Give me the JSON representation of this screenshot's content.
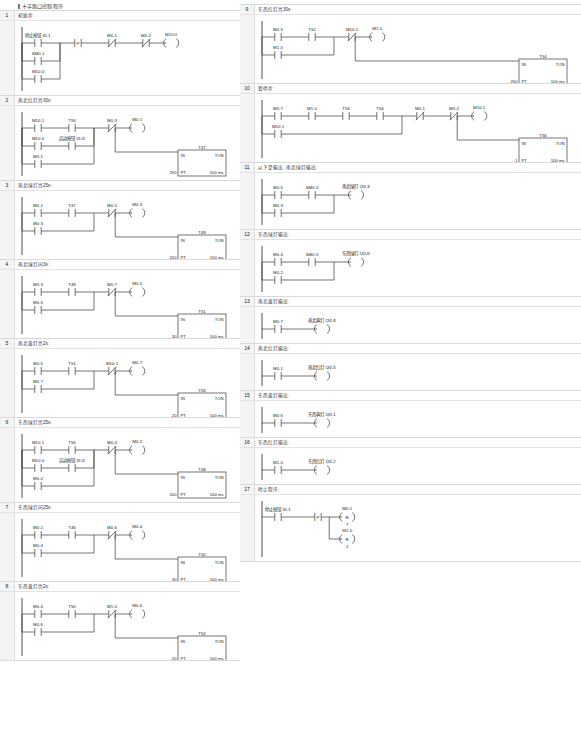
{
  "program": {
    "title": "十字路口控制程序",
    "left_column_rungs": [
      1,
      2,
      3,
      4,
      5,
      6,
      7,
      8
    ],
    "right_column_rungs": [
      9,
      10,
      11,
      12,
      13,
      14,
      15,
      16,
      17
    ]
  },
  "symbols": {
    "no_contact": "normally-open-contact",
    "nc_contact": "normally-closed-contact",
    "p_contact": "positive-transition-contact",
    "coil": "output-coil",
    "reset_coil": "reset-coil",
    "timer": "TON",
    "time_base": "100 ms"
  },
  "rungs": [
    {
      "number": "1",
      "comment": "初始步:",
      "branches": [
        {
          "contacts": [
            {
              "label": "停止按钮 I0.1",
              "type": "no"
            }
          ]
        },
        {
          "contacts": [
            {
              "label": "SM0.1",
              "type": "no"
            }
          ]
        },
        {
          "contacts": [
            {
              "label": "M10.0",
              "type": "no"
            }
          ]
        }
      ],
      "series_after": [
        {
          "label": "P",
          "type": "p"
        },
        {
          "label": "M0.1",
          "type": "nc"
        },
        {
          "label": "M0.2",
          "type": "nc"
        }
      ],
      "coil": {
        "label": "M10.0",
        "type": "coil"
      },
      "timer": null
    },
    {
      "number": "2",
      "comment": "南北红灯亮30s:",
      "branches": [
        {
          "contacts": [
            {
              "label": "M10.1",
              "type": "no"
            },
            {
              "label": "T55",
              "type": "no"
            }
          ]
        },
        {
          "contacts": [
            {
              "label": "M10.0",
              "type": "no"
            },
            {
              "label": "启动按钮 I0.0",
              "type": "no"
            }
          ]
        },
        {
          "contacts": [
            {
              "label": "M0.1",
              "type": "no"
            }
          ]
        }
      ],
      "series_after": [
        {
          "label": "M0.3",
          "type": "nc"
        }
      ],
      "coil": {
        "label": "M0.1",
        "type": "coil"
      },
      "timer": {
        "name": "T47",
        "pt": "250",
        "units": "100 ms",
        "mode": "TON"
      }
    },
    {
      "number": "3",
      "comment": "南北绿灯亮25s:",
      "branches": [
        {
          "contacts": [
            {
              "label": "M0.1",
              "type": "no"
            },
            {
              "label": "T47",
              "type": "no"
            }
          ]
        },
        {
          "contacts": [
            {
              "label": "M0.3",
              "type": "no"
            }
          ]
        }
      ],
      "series_after": [
        {
          "label": "M0.5",
          "type": "nc"
        }
      ],
      "coil": {
        "label": "M0.3",
        "type": "coil"
      },
      "timer": {
        "name": "T49",
        "pt": "200",
        "units": "100 ms",
        "mode": "TON"
      }
    },
    {
      "number": "4",
      "comment": "南北绿灯闪3s:",
      "branches": [
        {
          "contacts": [
            {
              "label": "M0.3",
              "type": "no"
            },
            {
              "label": "T49",
              "type": "no"
            }
          ]
        },
        {
          "contacts": [
            {
              "label": "M0.5",
              "type": "no"
            }
          ]
        }
      ],
      "series_after": [
        {
          "label": "M0.7",
          "type": "nc"
        }
      ],
      "coil": {
        "label": "M0.5",
        "type": "coil"
      },
      "timer": {
        "name": "T51",
        "pt": "30",
        "units": "100 ms",
        "mode": "TON"
      }
    },
    {
      "number": "5",
      "comment": "南北黄灯亮2s:",
      "branches": [
        {
          "contacts": [
            {
              "label": "M0.5",
              "type": "no"
            },
            {
              "label": "T51",
              "type": "no"
            }
          ]
        },
        {
          "contacts": [
            {
              "label": "M0.7",
              "type": "no"
            }
          ]
        }
      ],
      "series_after": [
        {
          "label": "M10.1",
          "type": "nc"
        }
      ],
      "coil": {
        "label": "M0.7",
        "type": "coil"
      },
      "timer": {
        "name": "T53",
        "pt": "20",
        "units": "100 ms",
        "mode": "TON"
      }
    },
    {
      "number": "6",
      "comment": "东西绿灯亮25s:",
      "branches": [
        {
          "contacts": [
            {
              "label": "M10.1",
              "type": "no"
            },
            {
              "label": "T55",
              "type": "no"
            }
          ]
        },
        {
          "contacts": [
            {
              "label": "M10.0",
              "type": "no"
            },
            {
              "label": "启动按钮 I0.0",
              "type": "no"
            }
          ]
        },
        {
          "contacts": [
            {
              "label": "M0.2",
              "type": "no"
            }
          ]
        }
      ],
      "series_after": [
        {
          "label": "M0.4",
          "type": "nc"
        }
      ],
      "coil": {
        "label": "M0.2",
        "type": "coil"
      },
      "timer": {
        "name": "T48",
        "pt": "200",
        "units": "100 ms",
        "mode": "TON"
      }
    },
    {
      "number": "7",
      "comment": "东西绿灯闪25s:",
      "branches": [
        {
          "contacts": [
            {
              "label": "M0.2",
              "type": "no"
            },
            {
              "label": "T46",
              "type": "no"
            }
          ]
        },
        {
          "contacts": [
            {
              "label": "M0.4",
              "type": "no"
            }
          ]
        }
      ],
      "series_after": [
        {
          "label": "M0.6",
          "type": "nc"
        }
      ],
      "coil": {
        "label": "M0.4",
        "type": "coil"
      },
      "timer": {
        "name": "T50",
        "pt": "30",
        "units": "100 ms",
        "mode": "TON"
      }
    },
    {
      "number": "8",
      "comment": "东西黄灯亮2s:",
      "branches": [
        {
          "contacts": [
            {
              "label": "M0.4",
              "type": "no"
            },
            {
              "label": "T50",
              "type": "no"
            }
          ]
        },
        {
          "contacts": [
            {
              "label": "M0.6",
              "type": "no"
            }
          ]
        }
      ],
      "series_after": [
        {
          "label": "M1.0",
          "type": "nc"
        }
      ],
      "coil": {
        "label": "M0.6",
        "type": "coil"
      },
      "timer": {
        "name": "T52",
        "pt": "20",
        "units": "100 ms",
        "mode": "TON"
      }
    },
    {
      "number": "9",
      "comment": "东西红灯亮30s:",
      "branches": [
        {
          "contacts": [
            {
              "label": "M0.5",
              "type": "no"
            },
            {
              "label": "T52",
              "type": "no"
            }
          ]
        },
        {
          "contacts": [
            {
              "label": "M1.0",
              "type": "no"
            }
          ]
        }
      ],
      "series_after": [
        {
          "label": "M10.1",
          "type": "nc"
        }
      ],
      "coil": {
        "label": "M1.0",
        "type": "coil"
      },
      "timer": {
        "name": "T54",
        "pt": "250",
        "units": "100 ms",
        "mode": "TON"
      }
    },
    {
      "number": "10",
      "comment": "暂停步:",
      "branches": [
        {
          "contacts": [
            {
              "label": "M0.7",
              "type": "no"
            },
            {
              "label": "M1.0",
              "type": "no"
            },
            {
              "label": "T53",
              "type": "no"
            },
            {
              "label": "T54",
              "type": "no"
            }
          ]
        },
        {
          "contacts": [
            {
              "label": "M10.1",
              "type": "no"
            }
          ]
        }
      ],
      "series_after": [
        {
          "label": "M0.1",
          "type": "nc"
        },
        {
          "label": "M0.2",
          "type": "nc"
        }
      ],
      "coil": {
        "label": "M10.1",
        "type": "coil"
      },
      "timer": {
        "name": "T56",
        "pt": "1",
        "units": "100 ms",
        "mode": "TON"
      }
    },
    {
      "number": "11",
      "comment": "以下是输出: 南北绿灯输出:",
      "branches": [
        {
          "contacts": [
            {
              "label": "M0.5",
              "type": "no"
            },
            {
              "label": "SM0.5",
              "type": "no"
            }
          ]
        },
        {
          "contacts": [
            {
              "label": "M0.3",
              "type": "no"
            }
          ]
        }
      ],
      "series_after": [],
      "coil": {
        "label": "南北绿灯 Q0.3",
        "type": "coil"
      },
      "timer": null
    },
    {
      "number": "12",
      "comment": "东西绿灯输出:",
      "branches": [
        {
          "contacts": [
            {
              "label": "M0.4",
              "type": "no"
            },
            {
              "label": "SM0.5",
              "type": "no"
            }
          ]
        },
        {
          "contacts": [
            {
              "label": "M0.2",
              "type": "no"
            }
          ]
        }
      ],
      "series_after": [],
      "coil": {
        "label": "东西绿灯 Q0.0",
        "type": "coil"
      },
      "timer": null
    },
    {
      "number": "13",
      "comment": "南北黄灯输出:",
      "branches": [
        {
          "contacts": [
            {
              "label": "M0.7",
              "type": "no"
            }
          ]
        }
      ],
      "series_after": [],
      "coil": {
        "label": "南北黄灯 Q0.4",
        "type": "coil"
      },
      "timer": null
    },
    {
      "number": "14",
      "comment": "南北红灯输出:",
      "branches": [
        {
          "contacts": [
            {
              "label": "M0.1",
              "type": "no"
            }
          ]
        }
      ],
      "series_after": [],
      "coil": {
        "label": "南北红灯 Q0.5",
        "type": "coil"
      },
      "timer": null
    },
    {
      "number": "15",
      "comment": "东西黄灯输出:",
      "branches": [
        {
          "contacts": [
            {
              "label": "M0.6",
              "type": "no"
            }
          ]
        }
      ],
      "series_after": [],
      "coil": {
        "label": "东西黄灯 Q0.1",
        "type": "coil"
      },
      "timer": null
    },
    {
      "number": "16",
      "comment": "东西红灯输出:",
      "branches": [
        {
          "contacts": [
            {
              "label": "M1.0",
              "type": "no"
            }
          ]
        }
      ],
      "series_after": [],
      "coil": {
        "label": "东西红灯 Q0.2",
        "type": "coil"
      },
      "timer": null
    },
    {
      "number": "17",
      "comment": "停止程序:",
      "branches": [
        {
          "contacts": [
            {
              "label": "停止按钮 I0.1",
              "type": "no"
            }
          ]
        }
      ],
      "series_after": [
        {
          "label": "P",
          "type": "p"
        }
      ],
      "coil": null,
      "reset_coils": [
        {
          "label": "M0.1",
          "op": "R",
          "count": "7"
        },
        {
          "label": "M1.0",
          "op": "R",
          "count": "2"
        }
      ],
      "timer": null
    }
  ]
}
